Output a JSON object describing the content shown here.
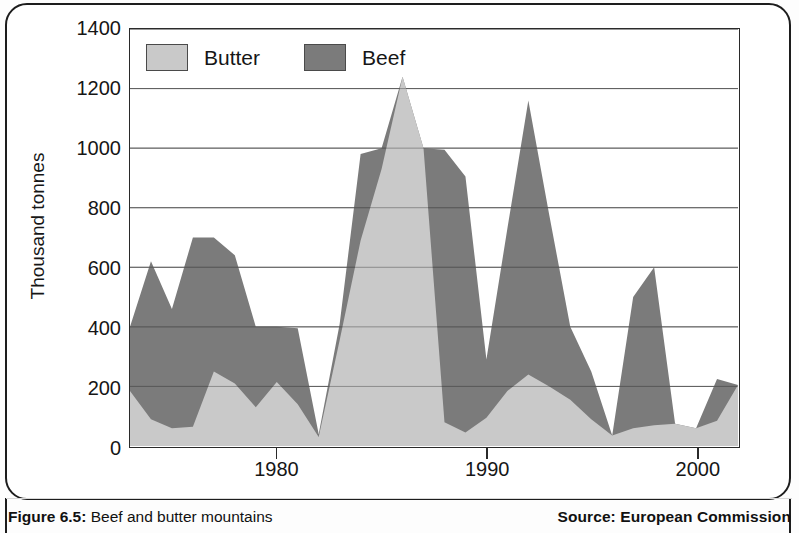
{
  "figure": {
    "caption_prefix": "Figure 6.5:",
    "caption_text": " Beef and butter mountains",
    "source": "Source: European Commission"
  },
  "axes": {
    "y_title": "Thousand tonnes",
    "y_ticks": [
      "1400",
      "1200",
      "1000",
      "800",
      "600",
      "400",
      "200",
      "0"
    ],
    "x_ticks": [
      "1980",
      "1990",
      "2000"
    ]
  },
  "legend": {
    "items": [
      {
        "label": "Butter",
        "color": "#c9c9c9"
      },
      {
        "label": "Beef",
        "color": "#7b7b7b"
      }
    ]
  },
  "colors": {
    "butter": "#c9c9c9",
    "beef": "#7b7b7b",
    "axis": "#2a2a2a",
    "grid": "#5a5a5a",
    "text": "#161616"
  },
  "chart_data": {
    "type": "area",
    "stacked": true,
    "title": "Beef and butter mountains",
    "xlabel": "",
    "ylabel": "Thousand tonnes",
    "ylim": [
      0,
      1400
    ],
    "xlim": [
      1973,
      2002
    ],
    "ytick_step": 200,
    "grid": true,
    "legend_position": "top-left",
    "x": [
      1973,
      1974,
      1975,
      1976,
      1977,
      1978,
      1979,
      1980,
      1981,
      1982,
      1983,
      1984,
      1985,
      1986,
      1987,
      1988,
      1989,
      1990,
      1991,
      1992,
      1993,
      1994,
      1995,
      1996,
      1997,
      1998,
      1999,
      2000,
      2001,
      2002
    ],
    "series": [
      {
        "name": "Butter",
        "values": [
          185,
          90,
          60,
          65,
          250,
          210,
          130,
          215,
          140,
          30,
          355,
          690,
          930,
          1240,
          1000,
          80,
          45,
          95,
          185,
          240,
          200,
          155,
          90,
          35,
          60,
          70,
          75,
          60,
          85,
          205
        ]
      },
      {
        "name": "Beef",
        "values": [
          215,
          530,
          400,
          635,
          450,
          430,
          270,
          185,
          255,
          10,
          55,
          290,
          70,
          0,
          0,
          915,
          860,
          195,
          545,
          920,
          575,
          245,
          160,
          0,
          440,
          530,
          0,
          0,
          140,
          0
        ]
      }
    ],
    "totals": [
      400,
      620,
      460,
      700,
      700,
      640,
      400,
      400,
      395,
      40,
      410,
      980,
      1000,
      1240,
      1000,
      995,
      905,
      290,
      730,
      1160,
      775,
      400,
      250,
      35,
      500,
      600,
      75,
      60,
      225,
      205
    ]
  }
}
